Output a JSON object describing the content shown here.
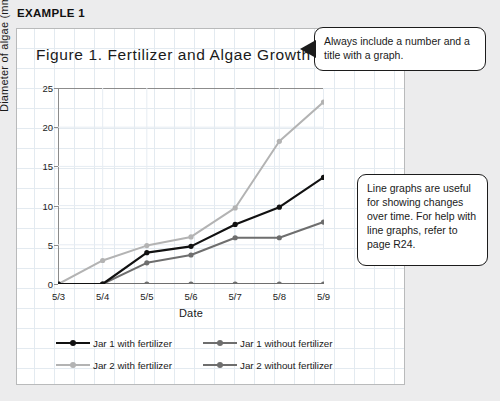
{
  "page": {
    "example_header": "EXAMPLE 1"
  },
  "callouts": {
    "title_note": "Always include a number and a title with a graph.",
    "usage_note": "Line graphs are useful for showing changes over time. For help with line graphs, refer to page R24."
  },
  "chart_data": {
    "type": "line",
    "title": "Figure 1. Fertilizer and Algae Growth",
    "xlabel": "Date",
    "ylabel": "Diameter of algae (mm)",
    "categories": [
      "5/3",
      "5/4",
      "5/5",
      "5/6",
      "5/7",
      "5/8",
      "5/9"
    ],
    "ylim": [
      0,
      25
    ],
    "yticks": [
      0,
      5,
      10,
      15,
      20,
      25
    ],
    "grid": true,
    "legend_position": "bottom",
    "series": [
      {
        "name": "Jar 1 with fertilizer",
        "color": "#111111",
        "values": [
          0,
          0,
          4.0,
          4.8,
          7.6,
          9.8,
          13.6
        ]
      },
      {
        "name": "Jar 1 without fertilizer",
        "color": "#6e6e6e",
        "values": [
          0,
          0,
          0,
          0,
          0,
          0,
          0
        ]
      },
      {
        "name": "Jar 2 with fertilizer",
        "color": "#b3b3b3",
        "values": [
          0,
          3.0,
          4.9,
          6.0,
          9.7,
          18.2,
          23.2
        ]
      },
      {
        "name": "Jar 2 without fertilizer",
        "color": "#6e6e6e",
        "values": [
          0,
          0,
          2.7,
          3.7,
          5.9,
          5.9,
          7.9
        ]
      }
    ]
  }
}
